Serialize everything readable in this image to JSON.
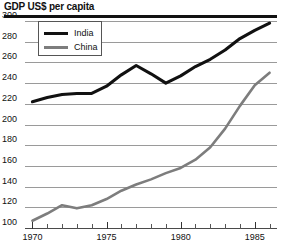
{
  "chart_data": {
    "type": "line",
    "title": "GDP US$ per capita",
    "xlabel": "",
    "ylabel": "",
    "ylim": [
      100,
      300
    ],
    "xlim": [
      1969.5,
      1986.5
    ],
    "ytick_values": [
      300,
      280,
      260,
      240,
      220,
      200,
      180,
      160,
      140,
      120,
      100
    ],
    "xtick_values": [
      1970,
      1971,
      1972,
      1973,
      1974,
      1975,
      1976,
      1977,
      1978,
      1979,
      1980,
      1981,
      1982,
      1983,
      1984,
      1985,
      1986
    ],
    "xtick_labels": [
      {
        "value": 1970,
        "label": "1970"
      },
      {
        "value": 1975,
        "label": "1975"
      },
      {
        "value": 1980,
        "label": "1980"
      },
      {
        "value": 1985,
        "label": "1985"
      }
    ],
    "grid": true,
    "legend_position": "top-left",
    "series": [
      {
        "name": "India",
        "color": "#111111",
        "x": [
          1970,
          1971,
          1972,
          1973,
          1974,
          1975,
          1976,
          1977,
          1978,
          1979,
          1980,
          1981,
          1982,
          1983,
          1984,
          1985,
          1986
        ],
        "values": [
          222,
          226,
          229,
          230,
          230,
          237,
          248,
          257,
          249,
          240,
          247,
          256,
          263,
          272,
          283,
          291,
          298
        ]
      },
      {
        "name": "China",
        "color": "#7d7d7d",
        "x": [
          1970,
          1971,
          1972,
          1973,
          1974,
          1975,
          1976,
          1977,
          1978,
          1979,
          1980,
          1981,
          1982,
          1983,
          1984,
          1985,
          1986
        ],
        "values": [
          107,
          114,
          122,
          119,
          122,
          128,
          136,
          142,
          147,
          153,
          158,
          166,
          178,
          196,
          218,
          238,
          250
        ]
      }
    ]
  },
  "legend": {
    "items": [
      {
        "label": "India"
      },
      {
        "label": "China"
      }
    ]
  },
  "colors": {
    "india": "#111111",
    "china": "#7d7d7d",
    "grid": "#9a9a9a",
    "axis": "#4a4a4a",
    "text": "#111111",
    "background": "#ffffff"
  }
}
